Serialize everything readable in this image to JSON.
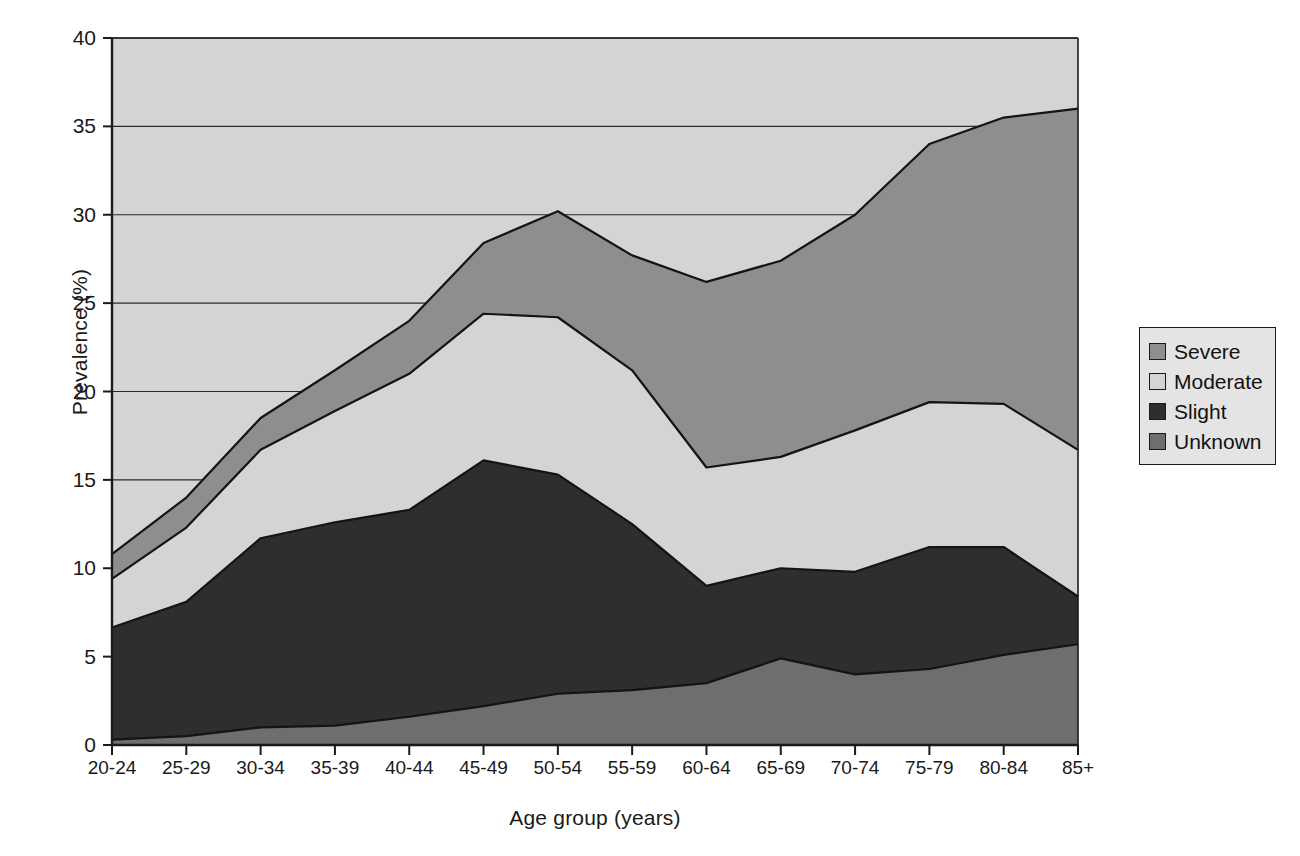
{
  "chart_data": {
    "type": "area",
    "stacked": true,
    "title": "",
    "xlabel": "Age group (years)",
    "ylabel": "Prevalence (%)",
    "categories": [
      "20-24",
      "25-29",
      "30-34",
      "35-39",
      "40-44",
      "45-49",
      "50-54",
      "55-59",
      "60-64",
      "65-69",
      "70-74",
      "75-79",
      "80-84",
      "85+"
    ],
    "ylim": [
      0,
      40
    ],
    "yticks": [
      0,
      5,
      10,
      15,
      20,
      25,
      30,
      35,
      40
    ],
    "ytick_labels": [
      "0",
      "5",
      "10",
      "15",
      "20",
      "25",
      "30",
      "35",
      "40"
    ],
    "grid": "horizontal",
    "legend_position": "right",
    "stack_order_bottom_to_top": [
      "Unknown",
      "Slight",
      "Moderate",
      "Severe"
    ],
    "series": [
      {
        "name": "Severe",
        "color": "#8e8e8e",
        "values": [
          1.4,
          1.7,
          1.8,
          2.3,
          3.0,
          4.0,
          6.0,
          6.5,
          7.1,
          8.8,
          12.1,
          14.5,
          16.1,
          19.3
        ]
      },
      {
        "name": "Moderate",
        "color": "#d4d4d4",
        "values": [
          2.75,
          4.2,
          5.0,
          6.3,
          7.7,
          8.3,
          8.9,
          8.7,
          6.7,
          6.3,
          8.0,
          8.2,
          8.1,
          8.3
        ]
      },
      {
        "name": "Slight",
        "color": "#2e2e2e",
        "values": [
          6.35,
          7.6,
          10.7,
          11.5,
          11.7,
          13.9,
          12.4,
          9.4,
          5.5,
          5.1,
          5.8,
          6.9,
          6.1,
          2.7
        ]
      },
      {
        "name": "Unknown",
        "color": "#6e6e6e",
        "values": [
          0.3,
          0.5,
          1.0,
          1.1,
          1.6,
          2.2,
          2.9,
          3.1,
          3.5,
          4.9,
          4.0,
          4.3,
          5.1,
          5.7
        ]
      }
    ],
    "cumulative_tops": {
      "Unknown": [
        0.3,
        0.5,
        1.0,
        1.1,
        1.6,
        2.2,
        2.9,
        3.1,
        3.5,
        4.9,
        4.0,
        4.3,
        5.1,
        5.7
      ],
      "Slight": [
        6.65,
        8.1,
        11.7,
        12.6,
        13.3,
        16.1,
        15.3,
        12.5,
        9.0,
        10.0,
        9.8,
        11.2,
        11.2,
        8.4
      ],
      "Moderate": [
        9.4,
        12.3,
        16.7,
        18.9,
        21.0,
        24.4,
        24.2,
        21.2,
        15.7,
        16.3,
        17.8,
        19.4,
        19.3,
        16.7
      ],
      "Severe": [
        10.8,
        14.0,
        18.5,
        21.2,
        24.0,
        28.4,
        30.2,
        27.7,
        26.2,
        27.4,
        30.0,
        34.0,
        35.5,
        36.0
      ]
    }
  },
  "legend": {
    "items": [
      {
        "label": "Severe"
      },
      {
        "label": "Moderate"
      },
      {
        "label": "Slight"
      },
      {
        "label": "Unknown"
      }
    ]
  },
  "colors": {
    "severe": "#8e8e8e",
    "moderate": "#d4d4d4",
    "slight": "#2e2e2e",
    "unknown": "#6e6e6e",
    "axis": "#1a1a1a",
    "grid": "#2a2a2a",
    "plot_background": "#d4d4d4",
    "legend_background": "#e4e4e4"
  }
}
